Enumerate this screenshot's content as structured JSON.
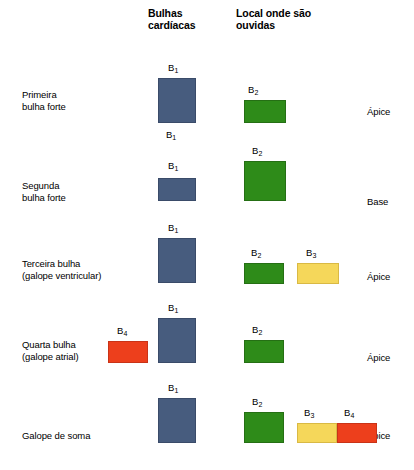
{
  "headers": {
    "sounds": "Bulhas\ncardíacas",
    "location": "Local onde são\nouvidas"
  },
  "colors": {
    "b1_blue": "#475c7e",
    "b2_green": "#2e8b19",
    "b3_yellow": "#f5d75a",
    "b4_red": "#ed3f1c",
    "background": "#ffffff",
    "text": "#000000"
  },
  "rows": [
    {
      "label": "Primeira\nbulha forte",
      "location": "Ápice",
      "sounds": [
        {
          "tag": "B",
          "sub": "1",
          "color": "blue",
          "left": 158,
          "top": 78,
          "width": 38,
          "height": 45,
          "tag_left": 168,
          "tag_top": 63
        },
        {
          "tag": "B",
          "sub": "2",
          "color": "green",
          "left": 244,
          "top": 100,
          "width": 42,
          "height": 23,
          "tag_left": 248,
          "tag_top": 85
        }
      ],
      "extra_tags": [
        {
          "tag": "B",
          "sub": "1",
          "left": 166,
          "top": 130
        }
      ]
    },
    {
      "label": "Segunda\nbulha forte",
      "location": "Base",
      "sounds": [
        {
          "tag": "B",
          "sub": "1",
          "color": "blue",
          "left": 158,
          "top": 178,
          "width": 38,
          "height": 23,
          "tag_left": 168,
          "tag_top": 161
        },
        {
          "tag": "B",
          "sub": "2",
          "color": "green",
          "left": 244,
          "top": 161,
          "width": 42,
          "height": 40,
          "tag_left": 252,
          "tag_top": 146
        }
      ],
      "extra_tags": []
    },
    {
      "label": "Terceira bulha\n(galope ventricular)",
      "location": "Ápice",
      "sounds": [
        {
          "tag": "B",
          "sub": "1",
          "color": "blue",
          "left": 158,
          "top": 238,
          "width": 38,
          "height": 45,
          "tag_left": 168,
          "tag_top": 223
        },
        {
          "tag": "B",
          "sub": "2",
          "color": "green",
          "left": 244,
          "top": 263,
          "width": 40,
          "height": 21,
          "tag_left": 251,
          "tag_top": 248
        },
        {
          "tag": "B",
          "sub": "3",
          "color": "yellow",
          "left": 297,
          "top": 263,
          "width": 42,
          "height": 21,
          "tag_left": 306,
          "tag_top": 248
        }
      ],
      "extra_tags": []
    },
    {
      "label": "Quarta bulha\n(galope atrial)",
      "location": "Ápice",
      "sounds": [
        {
          "tag": "B",
          "sub": "4",
          "color": "red",
          "left": 108,
          "top": 341,
          "width": 40,
          "height": 22,
          "tag_left": 117,
          "tag_top": 326
        },
        {
          "tag": "B",
          "sub": "1",
          "color": "blue",
          "left": 158,
          "top": 318,
          "width": 38,
          "height": 45,
          "tag_left": 168,
          "tag_top": 303
        },
        {
          "tag": "B",
          "sub": "2",
          "color": "green",
          "left": 244,
          "top": 340,
          "width": 40,
          "height": 23,
          "tag_left": 252,
          "tag_top": 325
        }
      ],
      "extra_tags": []
    },
    {
      "label": "Galope de soma",
      "location": "Ápice",
      "sounds": [
        {
          "tag": "B",
          "sub": "1",
          "color": "blue",
          "left": 158,
          "top": 398,
          "width": 38,
          "height": 45,
          "tag_left": 168,
          "tag_top": 383
        },
        {
          "tag": "B",
          "sub": "2",
          "color": "green",
          "left": 244,
          "top": 412,
          "width": 40,
          "height": 31,
          "tag_left": 252,
          "tag_top": 397
        },
        {
          "tag": "B",
          "sub": "3",
          "color": "yellow",
          "left": 297,
          "top": 423,
          "width": 40,
          "height": 20,
          "tag_left": 304,
          "tag_top": 408
        },
        {
          "tag": "B",
          "sub": "4",
          "color": "red",
          "left": 337,
          "top": 423,
          "width": 40,
          "height": 20,
          "tag_left": 344,
          "tag_top": 408
        }
      ],
      "extra_tags": []
    }
  ],
  "row_label_positions": [
    {
      "left": 22,
      "top": 89
    },
    {
      "left": 22,
      "top": 180
    },
    {
      "left": 22,
      "top": 258
    },
    {
      "left": 22,
      "top": 339
    },
    {
      "left": 22,
      "top": 430
    }
  ],
  "location_label_positions": [
    {
      "left": 367,
      "top": 106
    },
    {
      "left": 367,
      "top": 196
    },
    {
      "left": 367,
      "top": 271
    },
    {
      "left": 367,
      "top": 352
    },
    {
      "left": 367,
      "top": 430
    }
  ]
}
